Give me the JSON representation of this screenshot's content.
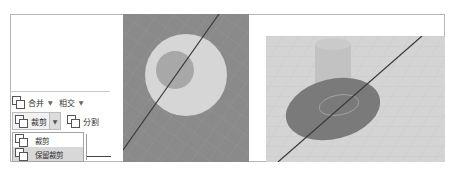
{
  "toolbar": {
    "row1": {
      "merge_label": "合并",
      "intersect_label": "相交"
    },
    "row2": {
      "trim_label": "裁剪",
      "split_label": "分割"
    },
    "dropdown": {
      "items": [
        {
          "label": "裁剪"
        },
        {
          "label": "保留裁剪"
        }
      ],
      "highlighted_index": 1
    },
    "icons": {
      "merge": "boolean-merge-icon",
      "intersect_caret": "chevron-down-icon",
      "trim": "boolean-trim-icon",
      "split": "boolean-split-icon"
    }
  },
  "viewports": {
    "top_view": {
      "description": "top view: large disk with small cylinder, cutting line"
    },
    "perspective_view": {
      "description": "perspective: disk and cylinder on grid, cutting line"
    }
  },
  "colors": {
    "viewport_dark": "#8a8a8a",
    "disk_light": "#d6d6d6",
    "disk_dark": "#7a7a7a",
    "grid_bg": "#d4d4d4",
    "cut_line": "#3a3a3a"
  }
}
